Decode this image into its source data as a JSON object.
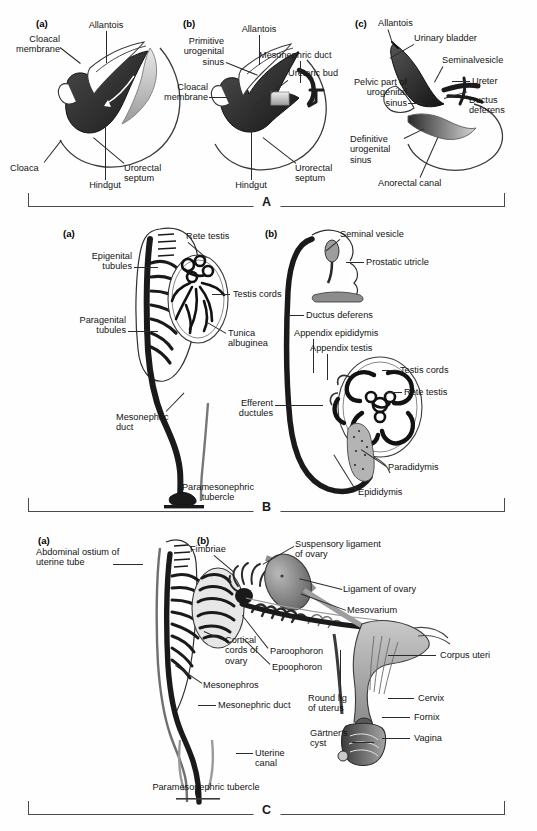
{
  "page": {
    "header_text": "",
    "figure_sections": [
      "A",
      "B",
      "C"
    ]
  },
  "sectionA": {
    "letter": "A",
    "panels": [
      {
        "tag": "(a)",
        "labels": [
          "Allantois",
          "Cloacal\nmembrane",
          "Cloacal membrane",
          "Cloaca",
          "Hindgut",
          "Urorectal\nseptum"
        ]
      },
      {
        "tag": "(b)",
        "labels": [
          "Primitive\nurogenital\nsinus",
          "Allantois",
          "Mesonephric duct",
          "Ureteric bud",
          "Cloacal\nmembrane",
          "Hindgut",
          "Urorectal\nseptum"
        ]
      },
      {
        "tag": "(c)",
        "labels": [
          "Allantois",
          "Urinary bladder",
          "Seminalvesicle",
          "Ureter",
          "Ductus\ndeferens",
          "Pelvic part of\nurogenital\nsinus",
          "Definitive\nurogenital\nsinus",
          "Anorectal canal"
        ]
      }
    ],
    "label_text": {
      "allantois_a": "Allantois",
      "cloacal_membrane_a": "Cloacal\nmembrane",
      "cloaca_a": "Cloaca",
      "hindgut_a": "Hindgut",
      "urorectal_septum_a": "Urorectal\nseptum",
      "primitive_urogenital_sinus_b": "Primitive\nurogenital\nsinus",
      "allantois_b": "Allantois",
      "mesonephric_duct_b": "Mesonephric duct",
      "ureteric_bud_b": "Ureteric bud",
      "cloacal_membrane_b": "Cloacal\nmembrane",
      "hindgut_b": "Hindgut",
      "urorectal_septum_b": "Urorectal\nseptum",
      "allantois_c": "Allantois",
      "urinary_bladder_c": "Urinary bladder",
      "seminal_vesicle_c": "Seminalvesicle",
      "ureter_c": "Ureter",
      "ductus_deferens_c": "Ductus\ndeferens",
      "pelvic_part_c": "Pelvic part of\nurogenital\nsinus",
      "definitive_sinus_c": "Definitive\nurogenital\nsinus",
      "anorectal_canal_c": "Anorectal canal"
    }
  },
  "sectionB": {
    "letter": "B",
    "panels": [
      {
        "tag": "(a)"
      },
      {
        "tag": "(b)"
      }
    ],
    "label_text": {
      "rete_testis_a": "Rete testis",
      "epigenital_tubules_a": "Epigenital\ntubules",
      "paragenital_tubules_a": "Paragenital\ntubules",
      "testis_cords_a": "Testis cords",
      "tunica_albuginea_a": "Tunica\nalbuginea",
      "mesonephric_duct_a": "Mesonephric\nduct",
      "paramesonephric_tubercle_a": "Paramesonephric\ntubercle",
      "seminal_vesicle_b": "Seminal vesicle",
      "prostatic_utricle_b": "Prostatic utricle",
      "ductus_deferens_b": "Ductus deferens",
      "appendix_epididymis_b": "Appendix epididymis",
      "appendix_testis_b": "Appendix testis",
      "testis_cords_b": "Testis cords",
      "rete_testis_b": "Rete testis",
      "efferent_ductules_b": "Efferent\nductules",
      "paradidymis_b": "Paradidymis",
      "epididymis_b": "Epididymis"
    }
  },
  "sectionC": {
    "letter": "C",
    "panels": [
      {
        "tag": "(a)"
      },
      {
        "tag": "(b)"
      }
    ],
    "label_text": {
      "abdominal_ostium_a": "Abdominal ostium of\nuterine tube",
      "cortical_cords_a": "Cortical\ncords of\novary",
      "mesonephros_a": "Mesonephros",
      "mesonephric_duct_a": "Mesonephric duct",
      "uterine_canal_a": "Uterine\ncanal",
      "paramesonephric_tubercle_a": "Paramesonephric tubercle",
      "fimbriae_b": "Fimbriae",
      "suspensory_ligament_b": "Suspensory ligament\nof ovary",
      "ligament_of_ovary_b": "Ligament of ovary",
      "mesovarium_b": "Mesovarium",
      "paroophoron_b": "Paroophoron",
      "epoophoron_b": "Epoophoron",
      "corpus_uteri_b": "Corpus uteri",
      "round_lig_b": "Round lig\nof uterus",
      "cervix_b": "Cervix",
      "fornix_b": "Fornix",
      "gartners_cyst_b": "Gärtner's\ncyst",
      "vagina_b": "Vagina"
    }
  },
  "colors": {
    "ink": "#141414",
    "leader": "#2b2b2b",
    "bracket": "#4a4a4a",
    "dark_fill": "#231f20",
    "mid_gray": "#8a8a8a",
    "light_gray": "#cfcfcf",
    "page_bg": "#fefefe"
  }
}
